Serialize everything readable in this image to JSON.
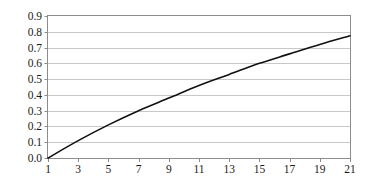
{
  "chart_data": {
    "type": "line",
    "title": "",
    "subtitle": "",
    "xlabel": "",
    "ylabel": "",
    "xlim": [
      1,
      21
    ],
    "ylim": [
      0.0,
      0.9
    ],
    "grid": "horizontal",
    "legend": "none",
    "x": [
      1,
      3,
      5,
      7,
      9,
      11,
      13,
      15,
      17,
      19,
      21
    ],
    "y": [
      0.0,
      0.11,
      0.21,
      0.3,
      0.38,
      0.46,
      0.53,
      0.6,
      0.66,
      0.72,
      0.775
    ],
    "series": [
      {
        "name": "",
        "color": "#111111",
        "x": [
          1,
          3,
          5,
          7,
          9,
          11,
          13,
          15,
          17,
          19,
          21
        ],
        "values": [
          0.0,
          0.11,
          0.21,
          0.3,
          0.38,
          0.46,
          0.53,
          0.6,
          0.66,
          0.72,
          0.775
        ]
      }
    ],
    "x_ticks": [
      1,
      3,
      5,
      7,
      9,
      11,
      13,
      15,
      17,
      19,
      21
    ],
    "x_tick_labels": [
      "1",
      "3",
      "5",
      "7",
      "9",
      "11",
      "13",
      "15",
      "17",
      "19",
      "21"
    ],
    "y_ticks": [
      0.0,
      0.1,
      0.2,
      0.3,
      0.4,
      0.5,
      0.6,
      0.7,
      0.8,
      0.9
    ],
    "y_tick_labels": [
      "0.0",
      "0.1",
      "0.2",
      "0.3",
      "0.4",
      "0.5",
      "0.6",
      "0.7",
      "0.8",
      "0.9"
    ],
    "colors": {
      "line": "#111111",
      "grid": "#c8c8c8",
      "border": "#8c8c8c",
      "text": "#1a1a1a",
      "background": "#ffffff"
    }
  }
}
